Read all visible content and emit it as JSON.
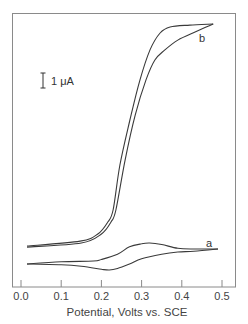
{
  "chart_data": {
    "type": "line",
    "title": "",
    "xlabel": "Potential, Volts vs. SCE",
    "ylabel": "",
    "xlim": [
      -0.02,
      0.53
    ],
    "x_ticks": [
      0.0,
      0.1,
      0.2,
      0.3,
      0.4,
      0.5
    ],
    "x_tick_labels": [
      "0.0",
      "0.1",
      "0.2",
      "0.3",
      "0.4",
      "0.5"
    ],
    "grid": false,
    "legend": "inline labels",
    "scale_bar": {
      "label": "1 μA",
      "value_uA": 1
    },
    "y_units": "μA (relative, arbitrary offset)",
    "series": [
      {
        "name": "a",
        "description": "cyclic voltammogram, small reversible wave",
        "forward": {
          "x": [
            0.015,
            0.1,
            0.18,
            0.2,
            0.24,
            0.27,
            0.3,
            0.32,
            0.35,
            0.39,
            0.43,
            0.49
          ],
          "y": [
            0.4,
            0.55,
            0.6,
            0.7,
            1.05,
            1.55,
            1.75,
            1.8,
            1.7,
            1.45,
            1.4,
            1.4
          ]
        },
        "reverse": {
          "x": [
            0.49,
            0.43,
            0.39,
            0.35,
            0.3,
            0.27,
            0.24,
            0.22,
            0.2,
            0.15,
            0.1,
            0.015
          ],
          "y": [
            1.4,
            1.25,
            1.2,
            1.05,
            0.75,
            0.4,
            0.1,
            0.0,
            0.05,
            0.25,
            0.35,
            0.4
          ]
        },
        "label_position": {
          "x": 0.47,
          "y": 1.75
        }
      },
      {
        "name": "b",
        "description": "cyclic voltammogram, large sigmoidal catalytic wave",
        "forward": {
          "x": [
            0.015,
            0.15,
            0.2,
            0.224,
            0.236,
            0.259,
            0.284,
            0.311,
            0.333,
            0.358,
            0.39,
            0.433,
            0.478
          ],
          "y": [
            1.53,
            1.8,
            2.4,
            3.2,
            4.0,
            7.33,
            10.33,
            12.67,
            14.0,
            14.67,
            15.33,
            15.87,
            16.4
          ]
        },
        "reverse": {
          "x": [
            0.478,
            0.42,
            0.371,
            0.346,
            0.321,
            0.296,
            0.271,
            0.246,
            0.229,
            0.216,
            0.191,
            0.147,
            0.015
          ],
          "y": [
            16.4,
            16.33,
            16.2,
            15.8,
            14.67,
            12.67,
            10.0,
            7.0,
            4.0,
            3.2,
            2.4,
            1.93,
            1.6
          ]
        },
        "label_position": {
          "x": 0.45,
          "y": 15.47
        }
      }
    ]
  },
  "labels": {
    "scale_text": "1 μA",
    "curve_a": "a",
    "curve_b": "b",
    "xlabel": "Potential, Volts vs. SCE",
    "ticks": [
      "0.0",
      "0.1",
      "0.2",
      "0.3",
      "0.4",
      "0.5"
    ]
  },
  "colors": {
    "frame": "#8a8a8a",
    "curve": "#3a3a3a",
    "text": "#444444",
    "background": "#ffffff"
  }
}
